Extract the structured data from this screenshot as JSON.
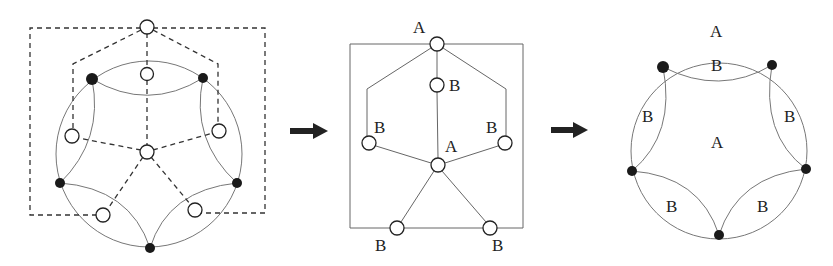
{
  "figure": {
    "panels": [
      {
        "id": "dual-graph-overlay",
        "description": "Circle partitioned by five lens regions with dual graph (dashed) overlaid",
        "filled_vertices": 5,
        "open_nodes": 7
      },
      {
        "id": "dual-graph",
        "labels": {
          "top": "A",
          "inner_top": "B",
          "left": "B",
          "right": "B",
          "center": "A",
          "bottom_left": "B",
          "bottom_right": "B"
        }
      },
      {
        "id": "labeled-regions",
        "labels": {
          "outer": "A",
          "top_lens": "B",
          "left_lens": "B",
          "right_lens": "B",
          "center": "A",
          "bottom_left_lens": "B",
          "bottom_right_lens": "B"
        }
      }
    ],
    "arrows": [
      "arrow-right",
      "arrow-right"
    ],
    "colors": {
      "line": "#666666",
      "dashed": "#333333",
      "dot": "#1a1a1a",
      "arrow": "#222222"
    }
  }
}
